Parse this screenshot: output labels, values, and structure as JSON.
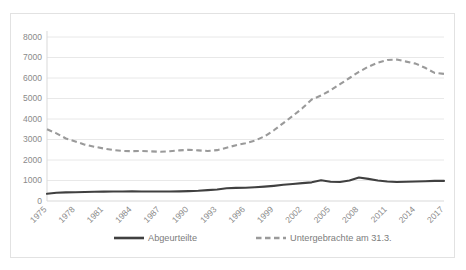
{
  "chart_data": {
    "type": "line",
    "title": "",
    "subtitle": "",
    "xlabel": "",
    "ylabel": "",
    "ylim": [
      0,
      8000
    ],
    "ytick_labels": [
      "0",
      "1000",
      "2000",
      "3000",
      "4000",
      "5000",
      "6000",
      "7000",
      "8000"
    ],
    "ytick_values": [
      0,
      1000,
      2000,
      3000,
      4000,
      5000,
      6000,
      7000,
      8000
    ],
    "grid": true,
    "legend_position": "bottom",
    "x": [
      1975,
      1976,
      1977,
      1978,
      1979,
      1980,
      1981,
      1982,
      1983,
      1984,
      1985,
      1986,
      1987,
      1988,
      1989,
      1990,
      1991,
      1992,
      1993,
      1994,
      1995,
      1996,
      1997,
      1998,
      1999,
      2000,
      2001,
      2002,
      2003,
      2004,
      2005,
      2006,
      2007,
      2008,
      2009,
      2010,
      2011,
      2012,
      2013,
      2014,
      2015,
      2016,
      2017
    ],
    "xtick_labels": [
      "1975",
      "1978",
      "1981",
      "1984",
      "1987",
      "1990",
      "1993",
      "1996",
      "1999",
      "2002",
      "2005",
      "2008",
      "2011",
      "2014",
      "2017"
    ],
    "xtick_values": [
      1975,
      1978,
      1981,
      1984,
      1987,
      1990,
      1993,
      1996,
      1999,
      2002,
      2005,
      2008,
      2011,
      2014,
      2017
    ],
    "series": [
      {
        "name": "Abgeurteilte",
        "style": "solid",
        "color": "#404040",
        "values": [
          350,
          400,
          420,
          430,
          440,
          450,
          455,
          460,
          465,
          470,
          465,
          460,
          460,
          465,
          470,
          480,
          500,
          530,
          560,
          620,
          640,
          650,
          670,
          700,
          740,
          790,
          830,
          870,
          910,
          1010,
          940,
          930,
          1000,
          1150,
          1080,
          1000,
          950,
          930,
          940,
          950,
          960,
          980,
          980
        ]
      },
      {
        "name": "Untergebrachte am 31.3.",
        "style": "dashed",
        "color": "#9a9a9a",
        "values": [
          3500,
          3300,
          3050,
          2900,
          2750,
          2650,
          2560,
          2490,
          2440,
          2430,
          2440,
          2420,
          2400,
          2430,
          2470,
          2500,
          2470,
          2440,
          2480,
          2600,
          2720,
          2820,
          2950,
          3150,
          3450,
          3800,
          4150,
          4520,
          4950,
          5150,
          5400,
          5700,
          6000,
          6300,
          6550,
          6750,
          6880,
          6900,
          6800,
          6700,
          6500,
          6250,
          6200
        ]
      }
    ]
  },
  "legend": {
    "items": [
      {
        "label": "Abgeurteilte",
        "style": "solid",
        "color": "#404040"
      },
      {
        "label": "Untergebrachte am 31.3.",
        "style": "dashed",
        "color": "#9a9a9a"
      }
    ]
  },
  "colors": {
    "series_solid": "#404040",
    "series_dashed": "#9a9a9a",
    "gridline": "#e8e8e8",
    "border": "#e2e2e2",
    "tick_text": "#8a8a8a",
    "legend_text": "#7c7c7c",
    "background": "#ffffff"
  }
}
